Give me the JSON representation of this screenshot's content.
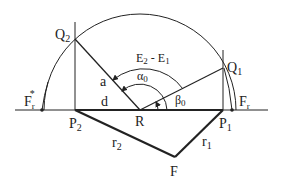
{
  "diagram": {
    "labels": {
      "Q2": "Q",
      "Q2_sub": "2",
      "Q1": "Q",
      "Q1_sub": "1",
      "E_label": "E",
      "E2_sub": "2",
      "E_minus": " - E",
      "E1_sub": "1",
      "alpha": "α",
      "alpha_sub": "0",
      "beta": "β",
      "beta_sub": "0",
      "a": "a",
      "d": "d",
      "R": "R",
      "P2": "P",
      "P2_sub": "2",
      "P1": "P",
      "P1_sub": "1",
      "Fr_star": "F",
      "Fr_star_sub": "r",
      "Fr_star_sup": "*",
      "Fr": "F",
      "Fr_sub": "r",
      "r2": "r",
      "r2_sub": "2",
      "r1": "r",
      "r1_sub": "1",
      "F": "F"
    },
    "colors": {
      "line": "#222222",
      "background": "#ffffff"
    }
  }
}
